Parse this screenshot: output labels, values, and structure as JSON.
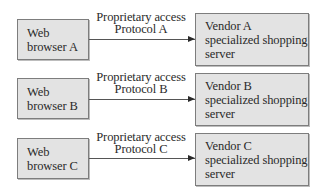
{
  "diagram": {
    "rows": [
      {
        "browser": {
          "line1": "Web",
          "line2": "browser A"
        },
        "link": {
          "line1": "Proprietary access",
          "line2": "Protocol A"
        },
        "server": {
          "line1": "Vendor A",
          "line2": "specialized shopping",
          "line3": "server"
        }
      },
      {
        "browser": {
          "line1": "Web",
          "line2": "browser B"
        },
        "link": {
          "line1": "Proprietary access",
          "line2": "Protocol B"
        },
        "server": {
          "line1": "Vendor B",
          "line2": "specialized shopping",
          "line3": "server"
        }
      },
      {
        "browser": {
          "line1": "Web",
          "line2": "browser C"
        },
        "link": {
          "line1": "Proprietary access",
          "line2": "Protocol C"
        },
        "server": {
          "line1": "Vendor C",
          "line2": "specialized shopping",
          "line3": "server"
        }
      }
    ],
    "colors": {
      "box_fill": "#e3e3e3",
      "box_border": "#7d7d7d",
      "arrow": "#2a2a2a",
      "text": "#2a2a2a"
    }
  }
}
